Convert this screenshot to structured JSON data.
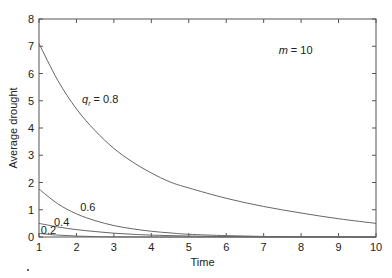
{
  "chart_data": {
    "type": "line",
    "title": "",
    "xlabel": "Time",
    "ylabel": "Average drought",
    "xlim": [
      1,
      10
    ],
    "ylim": [
      0,
      8
    ],
    "grid": false,
    "xticks": [
      "1",
      "2",
      "3",
      "4",
      "5",
      "6",
      "7",
      "8",
      "9",
      "10"
    ],
    "yticks": [
      "0",
      "1",
      "2",
      "3",
      "4",
      "5",
      "6",
      "7",
      "8"
    ],
    "series": [
      {
        "name": "q_r = 0.8",
        "label": "0.8",
        "x": [
          1,
          1.5,
          2,
          2.5,
          3,
          3.5,
          4,
          4.5,
          5,
          6,
          7,
          8,
          9,
          10
        ],
        "values": [
          7.1,
          5.75,
          4.7,
          3.9,
          3.25,
          2.75,
          2.35,
          2.02,
          1.8,
          1.42,
          1.12,
          0.88,
          0.67,
          0.5
        ]
      },
      {
        "name": "q_r = 0.6",
        "label": "0.6",
        "x": [
          1,
          1.5,
          2,
          2.5,
          3,
          3.5,
          4,
          4.5,
          5,
          6,
          7,
          8,
          9,
          10
        ],
        "values": [
          1.76,
          1.22,
          0.85,
          0.6,
          0.42,
          0.3,
          0.21,
          0.15,
          0.1,
          0.05,
          0.02,
          0.01,
          0.005,
          0.0
        ]
      },
      {
        "name": "q_r = 0.4",
        "label": "0.4",
        "x": [
          1,
          1.5,
          2,
          2.5,
          3,
          3.5,
          4,
          5,
          6,
          7,
          8,
          9,
          10
        ],
        "values": [
          0.5,
          0.37,
          0.27,
          0.2,
          0.14,
          0.1,
          0.07,
          0.035,
          0.015,
          0.005,
          0.0,
          0.0,
          0.0
        ]
      },
      {
        "name": "q_r = 0.2",
        "label": "0.2",
        "x": [
          1,
          1.5,
          2,
          2.5,
          3,
          4,
          5,
          10
        ],
        "values": [
          0.13,
          0.07,
          0.035,
          0.015,
          0.005,
          0.0,
          0.0,
          0.0
        ]
      }
    ],
    "annotations": [
      {
        "text_var": "q",
        "text_sub": "r",
        "text": " = 0.8",
        "x": 2.15,
        "y": 4.9
      },
      {
        "text": "0.6",
        "x": 2.1,
        "y": 0.95
      },
      {
        "text": "0.4",
        "x": 1.4,
        "y": 0.4
      },
      {
        "text": "0.2",
        "x": 1.05,
        "y": 0.12
      },
      {
        "text_var": "m",
        "text": " = 10",
        "x": 7.4,
        "y": 6.7
      }
    ]
  }
}
